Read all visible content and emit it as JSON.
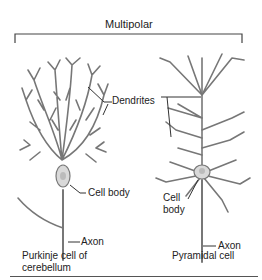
{
  "title": "Multipolar",
  "cells": [
    {
      "name": "Purkinje cell of cerebellum",
      "caption_line1": "Purkinje cell of",
      "caption_line2": "cerebellum",
      "labels": {
        "dendrites": "Dendrites",
        "cell_body": "Cell body",
        "axon": "Axon"
      }
    },
    {
      "name": "Pyramidal cell",
      "caption_line1": "Pyramidal cell",
      "labels": {
        "cell_body_line1": "Cell",
        "cell_body_line2": "body",
        "axon": "Axon"
      }
    }
  ],
  "colors": {
    "neuron_fill": "#d9d9d9",
    "neuron_stroke": "#6b6b6b",
    "line": "#333333"
  }
}
